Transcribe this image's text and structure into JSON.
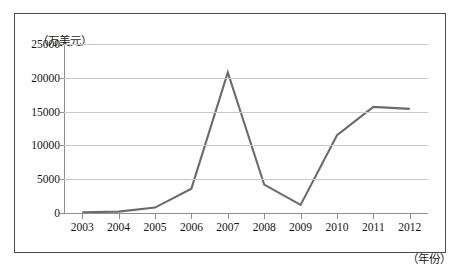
{
  "chart_data": {
    "type": "line",
    "title": "",
    "subtitle": "",
    "xlabel": "（年份）",
    "ylabel": "（万美元）",
    "categories": [
      "2003",
      "2004",
      "2005",
      "2006",
      "2007",
      "2008",
      "2009",
      "2010",
      "2011",
      "2012"
    ],
    "series": [
      {
        "name": "",
        "values": [
          120,
          200,
          800,
          3600,
          20800,
          4200,
          1200,
          11500,
          15700,
          15400
        ]
      }
    ],
    "ylim": [
      0,
      25000
    ],
    "yticks": [
      0,
      5000,
      10000,
      15000,
      20000,
      25000
    ],
    "ytick_labels": [
      "0",
      "5000",
      "10000",
      "15000",
      "20000",
      "25000"
    ],
    "grid": true,
    "grid_axis": "y",
    "legend": false,
    "legend_position": "none",
    "line_color": "#6b6b6b",
    "grid_color": "#c9c9c9",
    "axis_color": "#8f8f8f",
    "background_color": "#ffffff",
    "frame_color": "#4a4a4a"
  }
}
